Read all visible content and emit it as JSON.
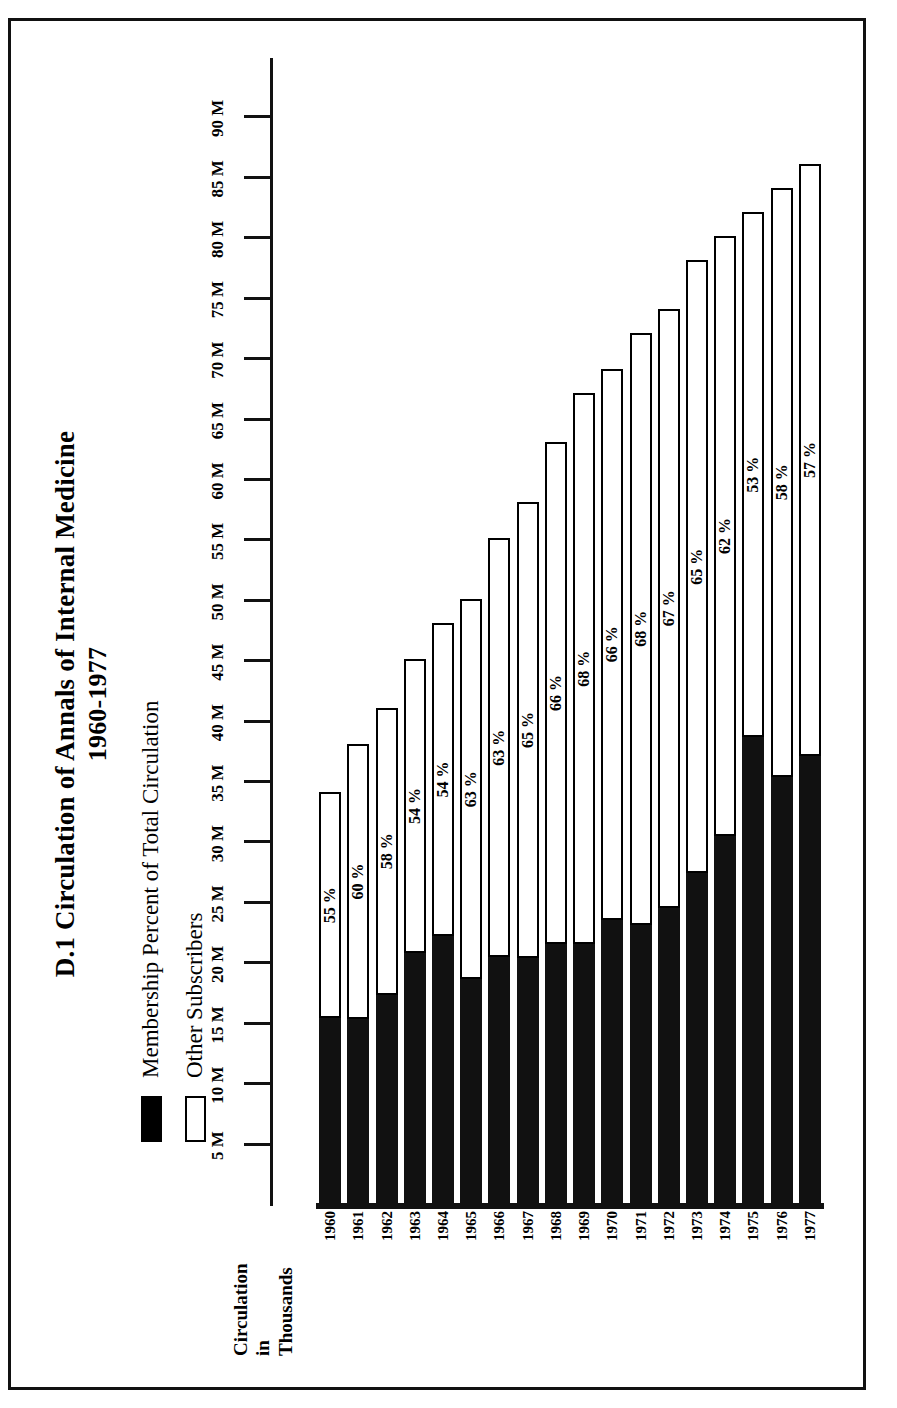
{
  "figure": {
    "title_line1": "D.1 Circulation of Annals of Internal Medicine",
    "title_line2": "1960-1977",
    "axis_title_line1": "Circulation",
    "axis_title_line2": "in",
    "axis_title_line3": "Thousands"
  },
  "legend": {
    "items": [
      {
        "label": "Membership Percent of Total Circulation",
        "swatch": "filled",
        "color": "#000000"
      },
      {
        "label": "Other Subscribers",
        "swatch": "hollow",
        "color": "#ffffff"
      }
    ]
  },
  "chart_data": {
    "type": "bar",
    "orientation": "horizontal-stacked",
    "title": "D.1 Circulation of Annals of Internal Medicine 1960-1977",
    "xlabel": "Circulation in Thousands",
    "ylabel": "",
    "grid": false,
    "legend_position": "top-left",
    "axis_tick_labels": [
      "90 M",
      "85 M",
      "80 M",
      "75 M",
      "70 M",
      "65 M",
      "60 M",
      "55 M",
      "50 M",
      "45 M",
      "40 M",
      "35 M",
      "30 M",
      "25 M",
      "20 M",
      "15 M",
      "10 M",
      "5 M"
    ],
    "axis_tick_values": [
      90,
      85,
      80,
      75,
      70,
      65,
      60,
      55,
      50,
      45,
      40,
      35,
      30,
      25,
      20,
      15,
      10,
      5
    ],
    "axis_units": "Thousands",
    "xlim": [
      0,
      95
    ],
    "categories": [
      "1960",
      "1961",
      "1962",
      "1963",
      "1964",
      "1965",
      "1966",
      "1967",
      "1968",
      "1969",
      "1970",
      "1971",
      "1972",
      "1973",
      "1974",
      "1975",
      "1976",
      "1977"
    ],
    "series": [
      {
        "name": "Membership Percent of Total Circulation",
        "data_labels": [
          "55 %",
          "60 %",
          "58 %",
          "54 %",
          "54 %",
          "63 %",
          "63 %",
          "65 %",
          "66 %",
          "68 %",
          "66 %",
          "68 %",
          "67 %",
          "65 %",
          "62 %",
          "53 %",
          "58 %",
          "57 %"
        ],
        "values": [
          55,
          60,
          58,
          54,
          54,
          63,
          63,
          65,
          66,
          68,
          66,
          68,
          67,
          65,
          62,
          53,
          58,
          57
        ]
      },
      {
        "name": "Other Subscribers",
        "values": [
          45,
          40,
          42,
          46,
          46,
          37,
          37,
          35,
          34,
          32,
          34,
          32,
          33,
          35,
          38,
          47,
          42,
          43
        ]
      }
    ],
    "total_circulation_thousands": [
      34,
      38,
      41,
      45,
      48,
      50,
      55,
      58,
      63,
      67,
      69,
      72,
      74,
      78,
      80,
      82,
      84,
      86
    ]
  }
}
